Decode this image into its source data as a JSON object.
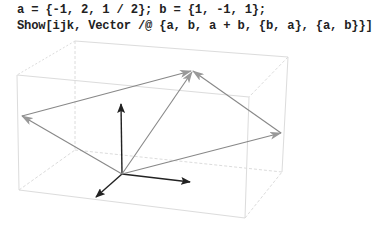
{
  "notebook": {
    "input_lines": [
      "a = {-1, 2, 1 / 2}; b = {1, -1, 1};",
      "Show[ijk, Vector /@ {a, b, a + b, {b, a}, {a, b}}]"
    ]
  },
  "graphic": {
    "type": "3d-vector-plot",
    "colors": {
      "box": "#d8d8d8",
      "axes": "#222222",
      "vectors": "#888888"
    },
    "axes_arrows": [
      "i",
      "j",
      "k"
    ],
    "vectors": [
      "a",
      "b",
      "a + b",
      "{b, a}",
      "{a, b}"
    ],
    "vector_a": [
      -1,
      2,
      0.5
    ],
    "vector_b": [
      1,
      -1,
      1
    ]
  }
}
